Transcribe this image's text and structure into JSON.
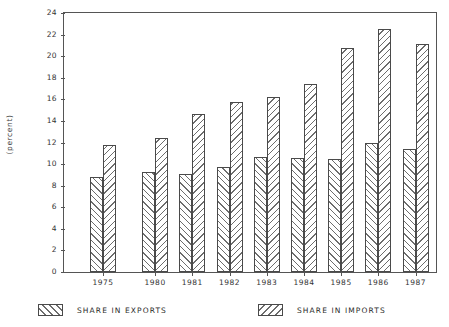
{
  "chart_data": {
    "type": "bar",
    "title": "",
    "subtitle": "",
    "xlabel": "",
    "ylabel": "(percent)",
    "categories": [
      "1975",
      "1980",
      "1981",
      "1982",
      "1983",
      "1984",
      "1985",
      "1986",
      "1987"
    ],
    "series": [
      {
        "name": "SHARE IN EXPORTS",
        "values": [
          8.8,
          9.3,
          9.1,
          9.7,
          10.7,
          10.6,
          10.5,
          12.0,
          11.4
        ]
      },
      {
        "name": "SHARE IN IMPORTS",
        "values": [
          11.8,
          12.4,
          14.6,
          15.8,
          16.2,
          17.4,
          20.8,
          22.5,
          21.1
        ]
      }
    ],
    "ylim": [
      0,
      24
    ],
    "ytick_labels": [
      "0",
      "2",
      "4",
      "6",
      "8",
      "10",
      "12",
      "14",
      "16",
      "18",
      "20",
      "22",
      "24"
    ],
    "ytick_values": [
      0,
      2,
      4,
      6,
      8,
      10,
      12,
      14,
      16,
      18,
      20,
      22,
      24
    ],
    "grid": false,
    "legend_position": "below-plot",
    "annotations": []
  },
  "legend": {
    "entries": [
      {
        "label": "SHARE IN EXPORTS",
        "pattern": "forward-diagonal-hatch"
      },
      {
        "label": "SHARE IN IMPORTS",
        "pattern": "backward-diagonal-hatch"
      }
    ]
  },
  "colors": {
    "axis": "#555555",
    "bar_outline": "#4a4a4a",
    "hatch": "#6d6d6d",
    "background": "#ffffff",
    "text": "#2b2b2b"
  }
}
